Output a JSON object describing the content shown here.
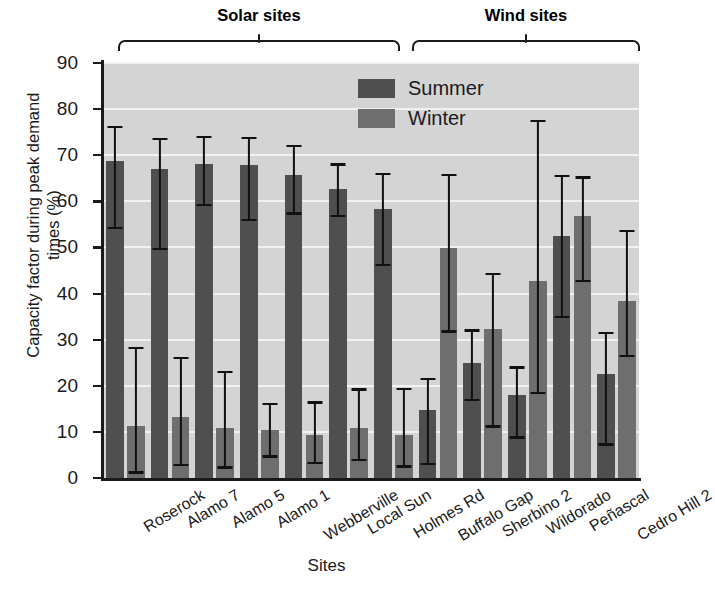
{
  "chart_data": {
    "type": "bar",
    "title": "",
    "xlabel": "Sites",
    "ylabel": "Capacity factor during peak demand times (%)",
    "ylim": [
      0,
      90
    ],
    "ytick_step": 10,
    "yticks": [
      "90",
      "80",
      "70",
      "60",
      "50",
      "40",
      "30",
      "20",
      "10",
      "0"
    ],
    "grid": true,
    "legend_position": "top-center",
    "categories": [
      "Roserock",
      "Alamo 7",
      "Alamo 5",
      "Alamo 1",
      "Webberville",
      "Local Sun",
      "Holmes Rd",
      "Buffalo Gap",
      "Sherbino 2",
      "Wildorado",
      "Peñascal",
      "Cedro Hill 2"
    ],
    "groups": [
      {
        "label": "Solar sites",
        "start": 0,
        "end": 6
      },
      {
        "label": "Wind sites",
        "start": 7,
        "end": 11
      }
    ],
    "series": [
      {
        "name": "Summer",
        "color": "#4f4f4f",
        "values": [
          68.8,
          67.0,
          68.1,
          67.8,
          65.8,
          62.6,
          58.4,
          14.7,
          24.9,
          18.0,
          52.5,
          22.6
        ],
        "err_low": [
          54.2,
          49.6,
          59.2,
          56.0,
          57.4,
          56.8,
          46.2,
          3.1,
          17.0,
          8.8,
          35.0,
          7.3
        ],
        "err_high": [
          76.2,
          73.5,
          74.0,
          73.8,
          72.0,
          68.0,
          66.0,
          21.5,
          32.0,
          24.0,
          65.5,
          31.5
        ]
      },
      {
        "name": "Winter",
        "color": "#6e6e6e",
        "values": [
          11.2,
          13.2,
          10.9,
          10.5,
          9.4,
          10.9,
          9.3,
          49.8,
          32.4,
          42.8,
          56.8,
          38.3
        ],
        "err_low": [
          1.2,
          2.8,
          2.3,
          4.7,
          3.3,
          4.0,
          2.5,
          31.8,
          11.2,
          18.5,
          42.8,
          26.5
        ],
        "err_high": [
          28.2,
          26.0,
          23.0,
          16.0,
          16.4,
          19.2,
          19.4,
          65.8,
          44.2,
          77.5,
          65.2,
          53.5
        ]
      }
    ]
  },
  "axis": {
    "y_title": "Capacity factor during peak demand times (%)",
    "x_title": "Sites"
  },
  "legend": {
    "items": [
      {
        "label": "Summer",
        "color": "#4f4f4f"
      },
      {
        "label": "Winter",
        "color": "#6e6e6e"
      }
    ]
  },
  "groups": [
    {
      "label": "Solar sites"
    },
    {
      "label": "Wind sites"
    }
  ]
}
